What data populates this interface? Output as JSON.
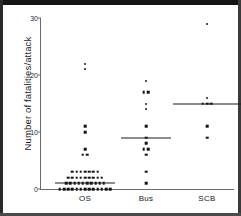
{
  "figure": {
    "caption_present": false
  },
  "chart_data": {
    "type": "scatter",
    "title": "",
    "xlabel": "",
    "ylabel": "Number of fatalities/attack",
    "ylim": [
      0,
      30
    ],
    "yticks": [
      0,
      10,
      20,
      30
    ],
    "ytick_labels": [
      "0",
      "10",
      "20",
      "30"
    ],
    "grid": false,
    "legend": "none",
    "categories": [
      "OS",
      "Bus",
      "SCB"
    ],
    "series": [
      {
        "name": "OS",
        "median": 1,
        "median_half_width": 30,
        "points": [
          {
            "y": 22,
            "n": 1
          },
          {
            "y": 21,
            "n": 1
          },
          {
            "y": 11,
            "n": 1
          },
          {
            "y": 10,
            "n": 1
          },
          {
            "y": 7,
            "n": 1
          },
          {
            "y": 6,
            "n": 2
          },
          {
            "y": 3,
            "n": 7
          },
          {
            "y": 2,
            "n": 9
          },
          {
            "y": 1,
            "n": 10
          },
          {
            "y": 0,
            "n": 13
          }
        ]
      },
      {
        "name": "Bus",
        "median": 9,
        "median_half_width": 25,
        "points": [
          {
            "y": 19,
            "n": 1
          },
          {
            "y": 17,
            "n": 2
          },
          {
            "y": 15,
            "n": 1
          },
          {
            "y": 14,
            "n": 1
          },
          {
            "y": 11,
            "n": 1
          },
          {
            "y": 9,
            "n": 1
          },
          {
            "y": 8,
            "n": 1
          },
          {
            "y": 7,
            "n": 2
          },
          {
            "y": 6,
            "n": 1
          },
          {
            "y": 3,
            "n": 1
          },
          {
            "y": 1,
            "n": 1
          }
        ]
      },
      {
        "name": "SCB",
        "median": 15,
        "median_half_width": 34,
        "points": [
          {
            "y": 29,
            "n": 1
          },
          {
            "y": 16,
            "n": 1
          },
          {
            "y": 15,
            "n": 3
          },
          {
            "y": 11,
            "n": 1
          },
          {
            "y": 9,
            "n": 1
          }
        ]
      }
    ]
  }
}
